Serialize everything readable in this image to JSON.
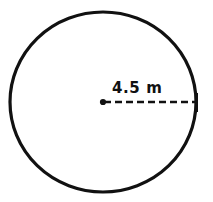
{
  "figure": {
    "kind": "geometry-diagram",
    "shape": "circle",
    "background_color": "#ffffff",
    "stroke_color": "#111111",
    "circle": {
      "center_x": 103,
      "center_y": 102,
      "radius_x": 94,
      "radius_y": 90,
      "stroke_width": 3
    },
    "radius_marker": {
      "label": "4.5 m",
      "value": 4.5,
      "unit": "m",
      "line_style": "dashed",
      "dash_length": 6,
      "dash_gap": 4,
      "stroke_width": 2,
      "from_x": 103,
      "from_y": 102,
      "to_x": 198,
      "to_y": 102,
      "center_dot_radius": 3
    },
    "end_tick": {
      "x": 196,
      "y_top": 92,
      "y_bottom": 112,
      "stroke_width": 3
    }
  }
}
